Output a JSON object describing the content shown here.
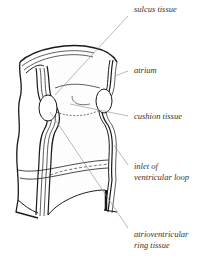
{
  "diagram": {
    "labels": [
      {
        "id": "sulcus",
        "lines": [
          "sulcus tissue"
        ]
      },
      {
        "id": "atrium",
        "lines": [
          "atrium"
        ]
      },
      {
        "id": "cushion",
        "lines": [
          "cushion tissue"
        ]
      },
      {
        "id": "inlet",
        "lines": [
          "inlet of",
          "ventricular loop"
        ]
      },
      {
        "id": "avring",
        "lines": [
          "atrioventricular",
          "ring tissue"
        ]
      }
    ],
    "colors": {
      "outline": "#1a1a1a",
      "leader": "#8a8a8a",
      "text": "#333333",
      "stipple": "#bbbbbb"
    }
  }
}
